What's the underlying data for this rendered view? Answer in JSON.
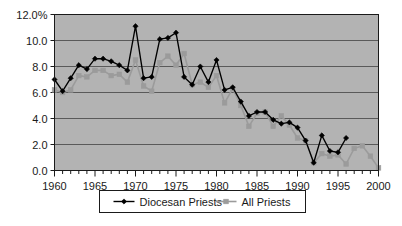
{
  "chart_data": {
    "type": "line",
    "title": "",
    "subtitle": "",
    "xlabel": "",
    "ylabel": "",
    "xlim": [
      1960,
      2000
    ],
    "ylim": [
      0.0,
      12.0
    ],
    "grid": true,
    "legend_position": "bottom",
    "plot_background": "#b3b3b3",
    "figure_background": "#ffffff",
    "x": [
      1960,
      1961,
      1962,
      1963,
      1964,
      1965,
      1966,
      1967,
      1968,
      1969,
      1970,
      1971,
      1972,
      1973,
      1974,
      1975,
      1976,
      1977,
      1978,
      1979,
      1980,
      1981,
      1982,
      1983,
      1984,
      1985,
      1986,
      1987,
      1988,
      1989,
      1990,
      1991,
      1992,
      1993,
      1994,
      1995,
      1996,
      1997,
      1998,
      1999,
      2000
    ],
    "series": [
      {
        "name": "Diocesan Priests",
        "color": "#000000",
        "marker": "diamond",
        "values": [
          7.0,
          6.1,
          7.1,
          8.1,
          7.8,
          8.6,
          8.6,
          8.4,
          8.1,
          7.7,
          11.1,
          7.1,
          7.2,
          10.1,
          10.2,
          10.6,
          7.2,
          6.6,
          8.0,
          6.8,
          8.5,
          6.2,
          6.4,
          5.3,
          4.2,
          4.5,
          4.5,
          3.9,
          3.6,
          3.7,
          3.3,
          2.3,
          0.6,
          2.7,
          1.5,
          1.4,
          2.5,
          null,
          null,
          null,
          null
        ]
      },
      {
        "name": "All Priests",
        "color": "#9b9b9b",
        "marker": "square",
        "values": [
          6.2,
          6.0,
          6.2,
          7.3,
          7.2,
          7.7,
          7.7,
          7.3,
          7.4,
          6.8,
          8.5,
          6.5,
          6.1,
          8.3,
          8.8,
          8.1,
          9.0,
          6.6,
          6.8,
          6.4,
          7.3,
          5.2,
          6.3,
          5.0,
          3.4,
          4.4,
          4.5,
          3.4,
          4.2,
          3.5,
          2.5,
          2.3,
          0.6,
          1.3,
          1.1,
          1.2,
          0.5,
          1.7,
          1.9,
          1.1,
          0.2
        ]
      }
    ],
    "y_ticks": [
      {
        "value": 12.0,
        "label": "12.0%"
      },
      {
        "value": 10.0,
        "label": "10.0"
      },
      {
        "value": 8.0,
        "label": "8.0"
      },
      {
        "value": 6.0,
        "label": "6.0"
      },
      {
        "value": 4.0,
        "label": "4.0"
      },
      {
        "value": 2.0,
        "label": "2.0"
      },
      {
        "value": 0.0,
        "label": "0.0"
      }
    ],
    "x_ticks": [
      {
        "value": 1960,
        "label": "1960"
      },
      {
        "value": 1965,
        "label": "1965"
      },
      {
        "value": 1970,
        "label": "1970"
      },
      {
        "value": 1975,
        "label": "1975"
      },
      {
        "value": 1980,
        "label": "1980"
      },
      {
        "value": 1985,
        "label": "1985"
      },
      {
        "value": 1990,
        "label": "1990"
      },
      {
        "value": 1995,
        "label": "1995"
      },
      {
        "value": 2000,
        "label": "2000"
      }
    ]
  },
  "legend": {
    "items": [
      {
        "label": "Diocesan Priests",
        "color": "#000000",
        "marker": "diamond"
      },
      {
        "label": "All Priests",
        "color": "#9b9b9b",
        "marker": "square"
      }
    ]
  }
}
